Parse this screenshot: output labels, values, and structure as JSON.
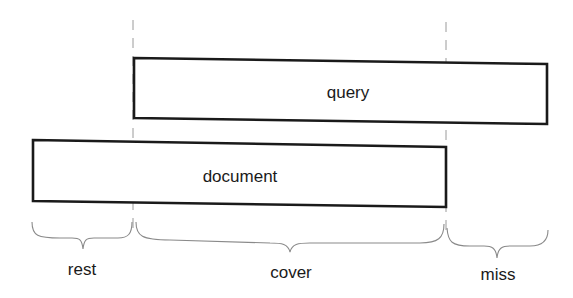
{
  "diagram": {
    "boxes": {
      "query": {
        "label": "query"
      },
      "document": {
        "label": "document"
      }
    },
    "segments": {
      "rest": {
        "label": "rest"
      },
      "cover": {
        "label": "cover"
      },
      "miss": {
        "label": "miss"
      }
    },
    "colors": {
      "box_stroke": "#1a1a1a",
      "guide": "#9a9a9a",
      "brace": "#8a8a8a",
      "background": "#ffffff"
    }
  }
}
